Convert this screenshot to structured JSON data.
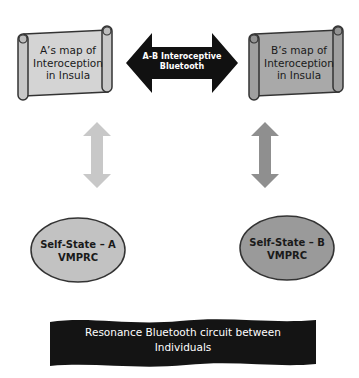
{
  "diagram": {
    "scroll_a": {
      "lines": [
        "A’s map of",
        "Interoception",
        "in Insula"
      ],
      "fill": "#d4d4d4"
    },
    "scroll_b": {
      "lines": [
        "B’s map of",
        "Interoception",
        "in Insula"
      ],
      "fill": "#a9a9a9"
    },
    "bidirectional_arrow": {
      "lines": [
        "A-B Interoceptive",
        "Bluetooth"
      ],
      "fill": "#111111",
      "text_color": "#ffffff"
    },
    "vertical_arrow_a": {
      "fill": "#c8c8c8"
    },
    "vertical_arrow_b": {
      "fill": "#8f8f8f"
    },
    "ellipse_a": {
      "lines": [
        "Self-State – A",
        "VMPRC"
      ],
      "fill": "#c2c2c2"
    },
    "ellipse_b": {
      "lines": [
        "Self-State – B",
        "VMPRC"
      ],
      "fill": "#9a9a9a"
    },
    "banner": {
      "lines": [
        "Resonance Bluetooth circuit between",
        "Individuals"
      ],
      "fill": "#141414",
      "text_color": "#ffffff"
    }
  }
}
